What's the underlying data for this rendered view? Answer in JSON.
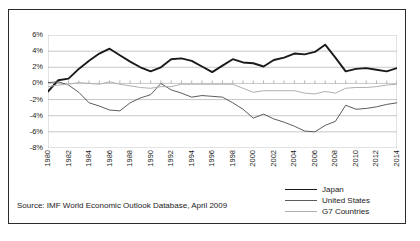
{
  "figure": {
    "source_note": "Source: IMF World Economic Outlook Database, April 2009"
  },
  "legend": {
    "position": "bottom-right",
    "entries": [
      {
        "label": "Japan",
        "color": "#1a1a1a",
        "width": 1.9
      },
      {
        "label": "United States",
        "color": "#5c5c5c",
        "width": 1.0
      },
      {
        "label": "G7 Countries",
        "color": "#b0b0b0",
        "width": 1.0
      }
    ]
  },
  "chart_data": {
    "type": "line",
    "title": "",
    "subtitle": "",
    "xlabel": "",
    "ylabel": "",
    "grid": true,
    "legend_position": "bottom-right",
    "xlim": [
      1980,
      2014
    ],
    "ylim": [
      -8,
      6
    ],
    "ytick_labels": [
      "6%",
      "4%",
      "2%",
      "0%",
      "-2%",
      "-4%",
      "-6%",
      "-8%"
    ],
    "ytick_values": [
      6,
      4,
      2,
      0,
      -2,
      -4,
      -6,
      -8
    ],
    "xtick_labels": [
      "1980",
      "1982",
      "1984",
      "1986",
      "1988",
      "1990",
      "1992",
      "1994",
      "1996",
      "1998",
      "2000",
      "2002",
      "2004",
      "2006",
      "2008",
      "2010",
      "2012",
      "2014"
    ],
    "xtick_values": [
      1980,
      1982,
      1984,
      1986,
      1988,
      1990,
      1992,
      1994,
      1996,
      1998,
      2000,
      2002,
      2004,
      2006,
      2008,
      2010,
      2012,
      2014
    ],
    "x": [
      1980,
      1981,
      1982,
      1983,
      1984,
      1985,
      1986,
      1987,
      1988,
      1989,
      1990,
      1991,
      1992,
      1993,
      1994,
      1995,
      1996,
      1997,
      1998,
      1999,
      2000,
      2001,
      2002,
      2003,
      2004,
      2005,
      2006,
      2007,
      2008,
      2009,
      2010,
      2011,
      2012,
      2013,
      2014
    ],
    "series": [
      {
        "name": "Japan",
        "color": "#1a1a1a",
        "width": 1.9,
        "values": [
          -1.0,
          0.4,
          0.6,
          1.8,
          2.8,
          3.7,
          4.3,
          3.5,
          2.7,
          2.0,
          1.5,
          2.0,
          3.0,
          3.1,
          2.8,
          2.1,
          1.4,
          2.2,
          3.0,
          2.6,
          2.5,
          2.1,
          2.9,
          3.2,
          3.7,
          3.6,
          3.9,
          4.8,
          3.2,
          1.5,
          1.8,
          1.9,
          1.7,
          1.5,
          1.9
        ]
      },
      {
        "name": "United States",
        "color": "#5c5c5c",
        "width": 1.0,
        "values": [
          0.1,
          0.2,
          -0.2,
          -1.1,
          -2.4,
          -2.8,
          -3.3,
          -3.4,
          -2.4,
          -1.8,
          -1.4,
          0.0,
          -0.8,
          -1.2,
          -1.7,
          -1.5,
          -1.6,
          -1.7,
          -2.4,
          -3.2,
          -4.3,
          -3.8,
          -4.4,
          -4.8,
          -5.3,
          -5.9,
          -6.0,
          -5.2,
          -4.7,
          -2.7,
          -3.2,
          -3.1,
          -2.9,
          -2.6,
          -2.4
        ]
      },
      {
        "name": "G7 Countries",
        "color": "#b0b0b0",
        "width": 1.0,
        "values": [
          -0.4,
          -0.2,
          -0.1,
          0.1,
          0.0,
          -0.1,
          0.2,
          -0.1,
          -0.3,
          -0.5,
          -0.6,
          -0.4,
          -0.4,
          -0.1,
          -0.1,
          -0.1,
          -0.1,
          -0.1,
          -0.1,
          -0.6,
          -1.1,
          -0.9,
          -0.9,
          -0.9,
          -0.9,
          -1.2,
          -1.3,
          -1.0,
          -1.2,
          -0.6,
          -0.5,
          -0.5,
          -0.4,
          -0.2,
          -0.1
        ]
      }
    ]
  }
}
